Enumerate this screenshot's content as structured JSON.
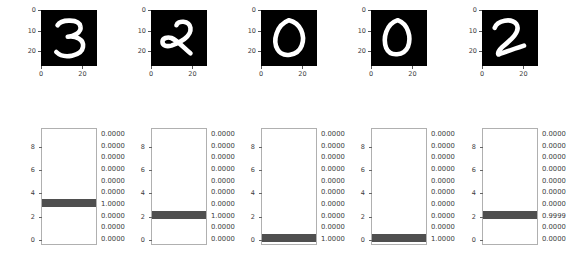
{
  "figure": {
    "width": 567,
    "height": 257,
    "background": "#ffffff",
    "bar_color": "#4f4f4f",
    "image_background": "#000000",
    "stroke_color": "#ffffff"
  },
  "chart_data": {
    "type": "bar",
    "title": "",
    "subtitle": "",
    "xlabel": "",
    "ylabel": "",
    "orientation": "horizontal",
    "categories": [
      "0",
      "1",
      "2",
      "3",
      "4",
      "5",
      "6",
      "7",
      "8",
      "9"
    ],
    "ylim": [
      -0.5,
      9.5
    ],
    "xlim": [
      0,
      1
    ],
    "grid": false,
    "legend": false,
    "y_ticks": [
      "0",
      "2",
      "4",
      "6",
      "8"
    ],
    "y_tick_values": [
      0,
      2,
      4,
      6,
      8
    ],
    "image_y_ticks": [
      "0",
      "10",
      "20"
    ],
    "image_y_tick_values": [
      0,
      10,
      20
    ],
    "image_x_ticks": [
      "0",
      "20"
    ],
    "image_x_tick_values": [
      0,
      20
    ],
    "panels": [
      {
        "index": 0,
        "digit_label": "3",
        "predicted_class": 3,
        "values": [
          0.0,
          0.0,
          0.0,
          1.0,
          0.0,
          0.0,
          0.0,
          0.0,
          0.0,
          0.0
        ],
        "value_labels": [
          "0.0000",
          "0.0000",
          "0.0000",
          "1.0000",
          "0.0000",
          "0.0000",
          "0.0000",
          "0.0000",
          "0.0000",
          "0.0000"
        ]
      },
      {
        "index": 1,
        "digit_label": "2",
        "predicted_class": 2,
        "values": [
          0.0,
          0.0,
          1.0,
          0.0,
          0.0,
          0.0,
          0.0,
          0.0,
          0.0,
          0.0
        ],
        "value_labels": [
          "0.0000",
          "0.0000",
          "1.0000",
          "0.0000",
          "0.0000",
          "0.0000",
          "0.0000",
          "0.0000",
          "0.0000",
          "0.0000"
        ]
      },
      {
        "index": 2,
        "digit_label": "0",
        "predicted_class": 0,
        "values": [
          1.0,
          0.0,
          0.0,
          0.0,
          0.0,
          0.0,
          0.0,
          0.0,
          0.0,
          0.0
        ],
        "value_labels": [
          "1.0000",
          "0.0000",
          "0.0000",
          "0.0000",
          "0.0000",
          "0.0000",
          "0.0000",
          "0.0000",
          "0.0000",
          "0.0000"
        ]
      },
      {
        "index": 3,
        "digit_label": "0",
        "predicted_class": 0,
        "values": [
          1.0,
          0.0,
          0.0,
          0.0,
          0.0,
          0.0,
          0.0,
          0.0,
          0.0,
          0.0
        ],
        "value_labels": [
          "1.0000",
          "0.0000",
          "0.0000",
          "0.0000",
          "0.0000",
          "0.0000",
          "0.0000",
          "0.0000",
          "0.0000",
          "0.0000"
        ]
      },
      {
        "index": 4,
        "digit_label": "2",
        "predicted_class": 2,
        "values": [
          0.0,
          0.0,
          0.9999,
          0.0,
          0.0,
          0.0,
          0.0,
          0.0,
          0.0,
          0.0
        ],
        "value_labels": [
          "0.0000",
          "0.0000",
          "0.9999",
          "0.0000",
          "0.0000",
          "0.0000",
          "0.0000",
          "0.0000",
          "0.0000",
          "0.0000"
        ]
      }
    ]
  }
}
